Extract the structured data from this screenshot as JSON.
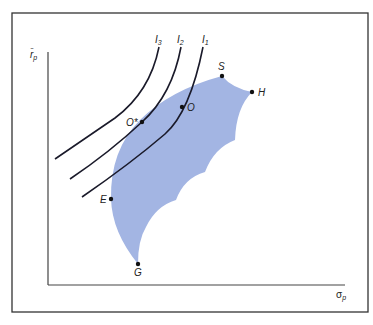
{
  "figure": {
    "axes": {
      "y_label_main": "r̄",
      "y_label_sub": "p",
      "x_label_main": "σ",
      "x_label_sub": "p"
    },
    "indifference_curves": [
      {
        "label": "I",
        "sub": "3"
      },
      {
        "label": "I",
        "sub": "2"
      },
      {
        "label": "I",
        "sub": "1"
      }
    ],
    "points": {
      "S": "S",
      "H": "H",
      "O": "O",
      "O_star": "O*",
      "E": "E",
      "G": "G"
    },
    "colors": {
      "feasible_region": "#a3b5e3",
      "lines": "#1a1a2a",
      "frame": "#333333"
    }
  }
}
